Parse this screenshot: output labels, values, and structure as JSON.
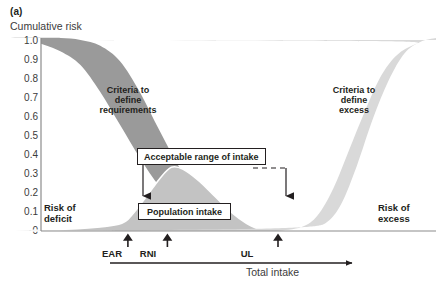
{
  "figure": {
    "panel_label": "(a)",
    "y_axis_title": "Cumulative risk",
    "x_axis_title": "Total intake"
  },
  "y_ticks": [
    "1.0",
    "0.9",
    "0.8",
    "0.7",
    "0.6",
    "0.5",
    "0.4",
    "0.3",
    "0.2",
    "0.1",
    "0"
  ],
  "band_labels": {
    "requirements": "Criteria to\ndefine\nrequirements",
    "requirements_line1": "Criteria to",
    "requirements_line2": "define",
    "requirements_line3": "requirements",
    "excess_line1": "Criteria to",
    "excess_line2": "define",
    "excess_line3": "excess"
  },
  "corner_labels": {
    "deficit_line1": "Risk of",
    "deficit_line2": "deficit",
    "excess_line1": "Risk of",
    "excess_line2": "excess"
  },
  "callouts": {
    "acceptable_range": "Acceptable range of intake",
    "population_intake": "Population intake"
  },
  "reference_points": {
    "ear": "EAR",
    "rni": "RNI",
    "ul": "UL"
  },
  "colors": {
    "requirement_band": "#9a9a9a",
    "excess_band": "#d9d9d9",
    "population_curve": "#c3c3c3",
    "axis": "#8c8c8c",
    "text": "#231f20",
    "callout_border": "#231f20",
    "background": "#ffffff"
  },
  "chart_data": {
    "type": "area",
    "xlabel": "Total intake",
    "ylabel": "Cumulative risk",
    "ylim": [
      0,
      1.0
    ],
    "y_tick_values": [
      0,
      0.1,
      0.2,
      0.3,
      0.4,
      0.5,
      0.6,
      0.7,
      0.8,
      0.9,
      1.0
    ],
    "grid": false,
    "legend": "none",
    "x_reference_markers": [
      {
        "label": "EAR",
        "x_fraction": 0.22,
        "meaning": "Estimated Average Requirement"
      },
      {
        "label": "RNI",
        "x_fraction": 0.32,
        "meaning": "Reference Nutrient Intake"
      },
      {
        "label": "UL",
        "x_fraction": 0.6,
        "meaning": "Upper Level"
      }
    ],
    "series": [
      {
        "name": "Criteria to define requirements",
        "kind": "band",
        "description": "Descending cumulative risk of deficiency; band between upper and lower bound curves falling from 1.0 to 0",
        "upper_bound": [
          {
            "x": 0.0,
            "y": 1.0
          },
          {
            "x": 0.05,
            "y": 1.0
          },
          {
            "x": 0.1,
            "y": 0.99
          },
          {
            "x": 0.15,
            "y": 0.96
          },
          {
            "x": 0.2,
            "y": 0.88
          },
          {
            "x": 0.25,
            "y": 0.72
          },
          {
            "x": 0.3,
            "y": 0.52
          },
          {
            "x": 0.35,
            "y": 0.33
          },
          {
            "x": 0.4,
            "y": 0.18
          },
          {
            "x": 0.45,
            "y": 0.08
          },
          {
            "x": 0.5,
            "y": 0.02
          },
          {
            "x": 0.54,
            "y": 0.0
          }
        ],
        "lower_bound": [
          {
            "x": 0.0,
            "y": 0.97
          },
          {
            "x": 0.05,
            "y": 0.93
          },
          {
            "x": 0.1,
            "y": 0.86
          },
          {
            "x": 0.15,
            "y": 0.72
          },
          {
            "x": 0.2,
            "y": 0.55
          },
          {
            "x": 0.25,
            "y": 0.38
          },
          {
            "x": 0.3,
            "y": 0.23
          },
          {
            "x": 0.35,
            "y": 0.12
          },
          {
            "x": 0.4,
            "y": 0.04
          },
          {
            "x": 0.44,
            "y": 0.0
          }
        ]
      },
      {
        "name": "Population intake",
        "kind": "distribution",
        "description": "Light grey frequency distribution of habitual population intakes peaking near RNI",
        "points": [
          {
            "x": 0.18,
            "y": 0.0
          },
          {
            "x": 0.22,
            "y": 0.06
          },
          {
            "x": 0.26,
            "y": 0.16
          },
          {
            "x": 0.3,
            "y": 0.27
          },
          {
            "x": 0.33,
            "y": 0.33
          },
          {
            "x": 0.36,
            "y": 0.32
          },
          {
            "x": 0.4,
            "y": 0.26
          },
          {
            "x": 0.44,
            "y": 0.18
          },
          {
            "x": 0.48,
            "y": 0.1
          },
          {
            "x": 0.52,
            "y": 0.04
          },
          {
            "x": 0.56,
            "y": 0.0
          }
        ],
        "peak": {
          "x": 0.33,
          "y": 0.33
        }
      },
      {
        "name": "Criteria to define excess",
        "kind": "band",
        "description": "Ascending cumulative risk of excess; band rising from 0 to 1.0 beyond the UL",
        "lower_bound": [
          {
            "x": 0.6,
            "y": 0.0
          },
          {
            "x": 0.66,
            "y": 0.02
          },
          {
            "x": 0.7,
            "y": 0.08
          },
          {
            "x": 0.74,
            "y": 0.22
          },
          {
            "x": 0.78,
            "y": 0.42
          },
          {
            "x": 0.82,
            "y": 0.62
          },
          {
            "x": 0.86,
            "y": 0.8
          },
          {
            "x": 0.9,
            "y": 0.91
          },
          {
            "x": 0.95,
            "y": 0.97
          },
          {
            "x": 1.0,
            "y": 0.99
          }
        ],
        "upper_bound": [
          {
            "x": 0.66,
            "y": 0.0
          },
          {
            "x": 0.72,
            "y": 0.04
          },
          {
            "x": 0.76,
            "y": 0.14
          },
          {
            "x": 0.8,
            "y": 0.34
          },
          {
            "x": 0.84,
            "y": 0.58
          },
          {
            "x": 0.88,
            "y": 0.78
          },
          {
            "x": 0.92,
            "y": 0.92
          },
          {
            "x": 0.96,
            "y": 0.98
          },
          {
            "x": 1.0,
            "y": 1.0
          }
        ]
      }
    ],
    "annotations": [
      {
        "text": "Risk of deficit",
        "x_fraction": 0.08,
        "y": 0.08
      },
      {
        "text": "Risk of excess",
        "x_fraction": 0.92,
        "y": 0.08
      },
      {
        "text": "Acceptable range of intake",
        "type": "callout-box",
        "spans_from": "EAR",
        "spans_to": "UL"
      },
      {
        "text": "Population intake",
        "type": "callout-box",
        "x_fraction": 0.35,
        "y": 0.07
      }
    ]
  }
}
